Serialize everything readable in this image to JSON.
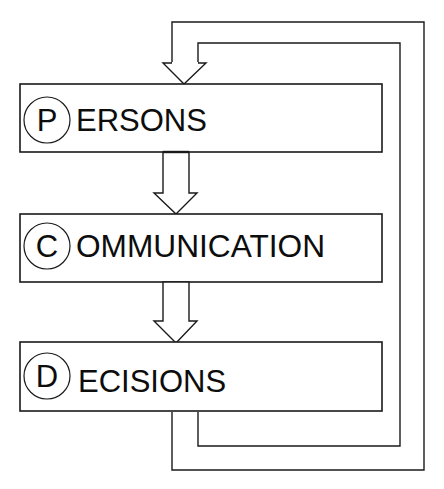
{
  "diagram": {
    "type": "flowchart-loop",
    "stroke_color": "#1a1a1a",
    "background": "#ffffff",
    "boxes": [
      {
        "id": "persons",
        "initial": "P",
        "rest": "ERSONS",
        "full_label": "PERSONS"
      },
      {
        "id": "communication",
        "initial": "C",
        "rest": "OMMUNICATION",
        "full_label": "COMMUNICATION"
      },
      {
        "id": "decisions",
        "initial": "D",
        "rest": "ECISIONS",
        "full_label": "DECISIONS"
      }
    ],
    "arrows": [
      {
        "from": "persons",
        "to": "communication",
        "style": "hollow-block-arrow"
      },
      {
        "from": "communication",
        "to": "decisions",
        "style": "hollow-block-arrow"
      },
      {
        "from": "decisions",
        "to": "persons",
        "style": "hollow-block-feedback-loop",
        "route": "right side, around"
      }
    ]
  }
}
